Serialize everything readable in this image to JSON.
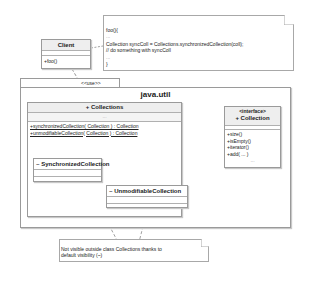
{
  "client": {
    "name": "Client",
    "operations": [
      "+foo()"
    ]
  },
  "code_note": {
    "lines": [
      "foo(){",
      "...",
      "Collection syncColl = Collections.synchronizedCollection(coll);",
      "// do something with syncColl",
      "...",
      "}"
    ]
  },
  "package": {
    "stereotype": "<<use>>",
    "name": "java.util"
  },
  "collections_class": {
    "name": "+ Collections",
    "attributes_placeholder": "...",
    "operations": [
      "+synchronizedCollection( Collection ) : Collection",
      "+unmodifiableCollection( Collection ) : Collection"
    ]
  },
  "synchronized_class": {
    "name": "~ SynchronizedCollection"
  },
  "unmodifiable_class": {
    "name": "~ UnmodifiableCollection"
  },
  "collection_interface": {
    "stereotype": "<interface>",
    "name": "+ Collection",
    "operations": [
      "+size()",
      "+isEmpty()",
      "+iterator()",
      "+add( ... )"
    ],
    "more": "..."
  },
  "visibility_note": {
    "lines": [
      "Not visible outside class Collections thanks to",
      "default visibility (~)"
    ]
  },
  "colors": {
    "border": "#9a9a9a",
    "header_fill": "#eeeeee",
    "line": "#666666"
  }
}
